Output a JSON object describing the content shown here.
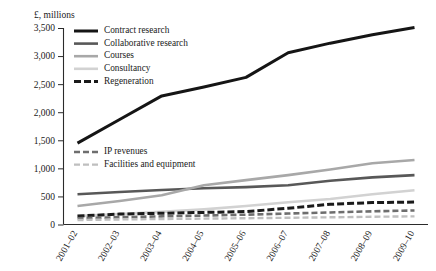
{
  "chart_data": {
    "type": "line",
    "title": "",
    "ylabel": "£, millions",
    "xlabel": "",
    "ylim": [
      0,
      3500
    ],
    "grid": false,
    "legend_position": "inside-top-left",
    "categories": [
      "2001–02",
      "2002–03",
      "2003–04",
      "2004–05",
      "2005–06",
      "2006–07",
      "2007–08",
      "2008–09",
      "2009–10"
    ],
    "ytick_labels": [
      "0",
      "500",
      "1,000",
      "1,500",
      "2,000",
      "2,500",
      "3,000",
      "3,500"
    ],
    "ytick_values": [
      0,
      500,
      1000,
      1500,
      2000,
      2500,
      3000,
      3500
    ],
    "series": [
      {
        "name": "Contract research",
        "values": [
          1450,
          1870,
          2290,
          2450,
          2620,
          3060,
          3230,
          3380,
          3510
        ],
        "color": "#151515",
        "width": 3.0,
        "dash": "none"
      },
      {
        "name": "Collaborative research",
        "values": [
          540,
          580,
          615,
          645,
          665,
          700,
          780,
          840,
          880
        ],
        "color": "#585858",
        "width": 2.6,
        "dash": "none"
      },
      {
        "name": "Courses",
        "values": [
          330,
          420,
          520,
          700,
          790,
          880,
          980,
          1090,
          1150
        ],
        "color": "#a8a8a8",
        "width": 2.6,
        "dash": "none"
      },
      {
        "name": "Consultancy",
        "values": [
          150,
          185,
          225,
          270,
          330,
          395,
          455,
          540,
          610
        ],
        "color": "#d2d2d2",
        "width": 2.6,
        "dash": "none"
      },
      {
        "name": "Regeneration",
        "values": [
          150,
          185,
          200,
          215,
          230,
          290,
          360,
          390,
          400
        ],
        "color": "#1a1a1a",
        "width": 3.0,
        "dash": "7 3"
      },
      {
        "name": "IP revenues",
        "values": [
          110,
          130,
          145,
          160,
          175,
          195,
          215,
          235,
          250
        ],
        "color": "#6e6e6e",
        "width": 2.6,
        "dash": "6 3"
      },
      {
        "name": "Facilities and equipment",
        "values": [
          80,
          90,
          98,
          105,
          112,
          120,
          128,
          138,
          145
        ],
        "color": "#bfbfbf",
        "width": 2.4,
        "dash": "6 3"
      }
    ]
  },
  "axis": {
    "unit_label": "£, millions"
  },
  "legend_primary": {
    "items": [
      {
        "label": "Contract research"
      },
      {
        "label": "Collaborative research"
      },
      {
        "label": "Courses"
      },
      {
        "label": "Consultancy"
      },
      {
        "label": "Regeneration"
      }
    ]
  },
  "legend_secondary": {
    "items": [
      {
        "label": "IP revenues"
      },
      {
        "label": "Facilities and equipment"
      }
    ]
  }
}
